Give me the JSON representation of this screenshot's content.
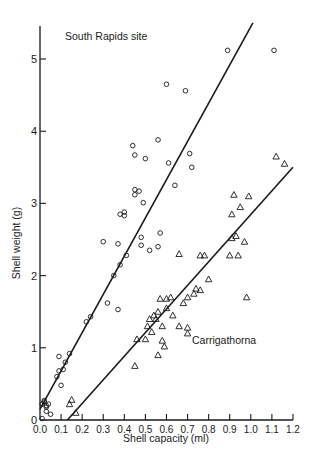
{
  "chart_data": {
    "type": "scatter",
    "title": "",
    "xlabel": "Shell capacity (ml)",
    "ylabel": "Shell weight (g)",
    "xlim": [
      0.0,
      1.2
    ],
    "ylim": [
      0,
      5.5
    ],
    "x_ticks": [
      "0.0",
      "0.1",
      "0.2",
      "0.3",
      "0.4",
      "0.5",
      "0.6",
      "0.7",
      "0.8",
      "0.9",
      "1.0",
      "1.1",
      "1.2"
    ],
    "y_ticks": [
      "0",
      "1",
      "2",
      "3",
      "4",
      "5"
    ],
    "grid": false,
    "annotations": [
      {
        "text": "South Rapids site",
        "x": 0.1,
        "y": 5.35
      },
      {
        "text": "Carrigathorna",
        "x": 0.73,
        "y": 1.0
      }
    ],
    "series": [
      {
        "name": "South Rapids site",
        "marker": "circle",
        "points": [
          [
            0.01,
            0.02
          ],
          [
            0.01,
            0.22
          ],
          [
            0.02,
            0.25
          ],
          [
            0.03,
            0.18
          ],
          [
            0.03,
            0.2
          ],
          [
            0.04,
            0.22
          ],
          [
            0.03,
            0.12
          ],
          [
            0.05,
            0.08
          ],
          [
            0.02,
            0.27
          ],
          [
            0.08,
            0.6
          ],
          [
            0.09,
            0.68
          ],
          [
            0.09,
            0.88
          ],
          [
            0.1,
            0.48
          ],
          [
            0.11,
            0.7
          ],
          [
            0.12,
            0.8
          ],
          [
            0.14,
            0.92
          ],
          [
            0.22,
            1.36
          ],
          [
            0.24,
            1.43
          ],
          [
            0.3,
            2.47
          ],
          [
            0.32,
            1.62
          ],
          [
            0.35,
            2.0
          ],
          [
            0.37,
            1.53
          ],
          [
            0.37,
            2.44
          ],
          [
            0.38,
            2.15
          ],
          [
            0.38,
            2.85
          ],
          [
            0.4,
            2.88
          ],
          [
            0.4,
            2.83
          ],
          [
            0.41,
            2.28
          ],
          [
            0.44,
            3.8
          ],
          [
            0.45,
            3.67
          ],
          [
            0.45,
            3.19
          ],
          [
            0.45,
            3.12
          ],
          [
            0.47,
            3.17
          ],
          [
            0.48,
            2.53
          ],
          [
            0.48,
            2.42
          ],
          [
            0.49,
            3.01
          ],
          [
            0.5,
            3.62
          ],
          [
            0.52,
            2.35
          ],
          [
            0.56,
            2.4
          ],
          [
            0.57,
            2.59
          ],
          [
            0.56,
            3.88
          ],
          [
            0.6,
            4.65
          ],
          [
            0.61,
            3.56
          ],
          [
            0.64,
            3.25
          ],
          [
            0.69,
            4.56
          ],
          [
            0.71,
            3.69
          ],
          [
            0.72,
            3.5
          ],
          [
            0.89,
            5.12
          ],
          [
            1.11,
            5.12
          ]
        ],
        "fit_line": {
          "from": [
            0.0,
            0.15
          ],
          "to": [
            1.01,
            5.5
          ]
        }
      },
      {
        "name": "Carrigathorna",
        "marker": "triangle",
        "points": [
          [
            0.14,
            0.22
          ],
          [
            0.15,
            0.28
          ],
          [
            0.17,
            0.1
          ],
          [
            0.45,
            0.75
          ],
          [
            0.46,
            1.12
          ],
          [
            0.5,
            1.12
          ],
          [
            0.51,
            1.3
          ],
          [
            0.52,
            1.4
          ],
          [
            0.53,
            1.22
          ],
          [
            0.54,
            1.45
          ],
          [
            0.55,
            1.4
          ],
          [
            0.56,
            1.5
          ],
          [
            0.56,
            0.9
          ],
          [
            0.57,
            1.68
          ],
          [
            0.58,
            1.3
          ],
          [
            0.58,
            1.1
          ],
          [
            0.59,
            1.02
          ],
          [
            0.6,
            1.68
          ],
          [
            0.6,
            1.55
          ],
          [
            0.62,
            1.7
          ],
          [
            0.63,
            1.45
          ],
          [
            0.66,
            1.3
          ],
          [
            0.66,
            2.3
          ],
          [
            0.68,
            1.62
          ],
          [
            0.7,
            1.7
          ],
          [
            0.7,
            1.2
          ],
          [
            0.7,
            1.28
          ],
          [
            0.73,
            1.75
          ],
          [
            0.74,
            1.82
          ],
          [
            0.76,
            1.8
          ],
          [
            0.76,
            2.28
          ],
          [
            0.78,
            2.28
          ],
          [
            0.8,
            1.95
          ],
          [
            0.9,
            2.28
          ],
          [
            0.91,
            2.52
          ],
          [
            0.91,
            2.85
          ],
          [
            0.92,
            3.12
          ],
          [
            0.93,
            2.55
          ],
          [
            0.94,
            2.28
          ],
          [
            0.95,
            2.95
          ],
          [
            0.97,
            2.47
          ],
          [
            0.98,
            1.7
          ],
          [
            0.99,
            3.1
          ],
          [
            1.12,
            3.65
          ],
          [
            1.16,
            3.55
          ]
        ],
        "fit_line": {
          "from": [
            0.13,
            0.0
          ],
          "to": [
            1.2,
            3.5
          ]
        }
      }
    ]
  }
}
